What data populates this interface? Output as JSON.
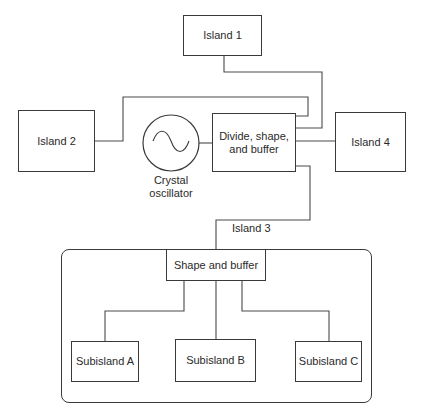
{
  "diagram": {
    "type": "block-diagram",
    "title": "",
    "nodes": {
      "island1": {
        "label": "Island 1"
      },
      "island2": {
        "label": "Island 2"
      },
      "island4": {
        "label": "Island 4"
      },
      "oscillator": {
        "label_line1": "Crystal",
        "label_line2": "oscillator",
        "icon": "sine-wave-icon"
      },
      "divide": {
        "label_line1": "Divide, shape,",
        "label_line2": "and buffer"
      },
      "island3": {
        "label": "Island 3"
      },
      "shape_buffer": {
        "label": "Shape and buffer"
      },
      "subisland_a": {
        "label": "Subisland A"
      },
      "subisland_b": {
        "label": "Subisland B"
      },
      "subisland_c": {
        "label": "Subisland C"
      }
    },
    "edges": [
      {
        "from": "Island 1",
        "to": "Divide, shape, and buffer"
      },
      {
        "from": "Island 2",
        "to": "Divide, shape, and buffer"
      },
      {
        "from": "Crystal oscillator",
        "to": "Divide, shape, and buffer"
      },
      {
        "from": "Divide, shape, and buffer",
        "to": "Island 4"
      },
      {
        "from": "Divide, shape, and buffer",
        "to": "Island 3 / Shape and buffer"
      },
      {
        "from": "Shape and buffer",
        "to": "Subisland A"
      },
      {
        "from": "Shape and buffer",
        "to": "Subisland B"
      },
      {
        "from": "Shape and buffer",
        "to": "Subisland C"
      }
    ],
    "colors": {
      "line": "#4a4a4a",
      "text": "#2a2a2a",
      "background": "#ffffff"
    }
  }
}
